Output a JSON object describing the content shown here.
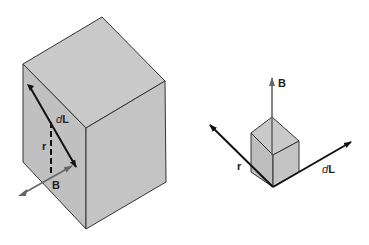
{
  "figure": {
    "left_panel": {
      "labels": {
        "dL_prefix": "d",
        "dL_suffix": "L",
        "r": "r",
        "B": "B"
      }
    },
    "right_panel": {
      "labels": {
        "B": "B",
        "r": "r",
        "dL_prefix": "d",
        "dL_suffix": "L"
      }
    },
    "colors": {
      "cube_face": "#c2c2c2",
      "cube_top": "#c9c9c9",
      "edge": "#333333",
      "arrow_dark": "#111111",
      "arrow_gray": "#666666"
    }
  }
}
